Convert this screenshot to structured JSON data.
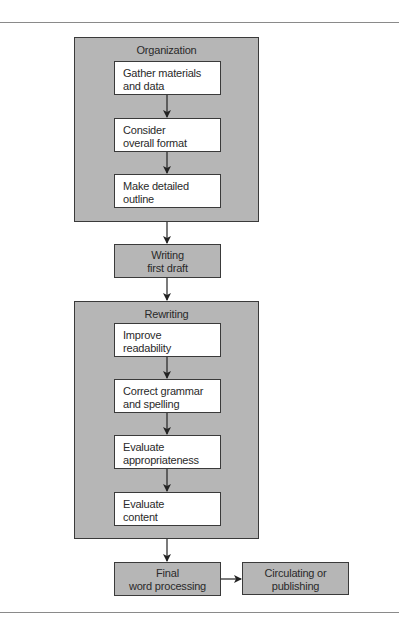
{
  "diagram": {
    "type": "flowchart",
    "groups": [
      {
        "id": "organization",
        "title": "Organization",
        "steps": [
          {
            "lines": [
              "Gather materials",
              "and data"
            ]
          },
          {
            "lines": [
              "Consider",
              "overall format"
            ]
          },
          {
            "lines": [
              "Make detailed",
              "outline"
            ]
          }
        ]
      },
      {
        "id": "rewriting",
        "title": "Rewriting",
        "steps": [
          {
            "lines": [
              "Improve",
              "readability"
            ]
          },
          {
            "lines": [
              "Correct grammar",
              "and spelling"
            ]
          },
          {
            "lines": [
              "Evaluate",
              "appropriateness"
            ]
          },
          {
            "lines": [
              "Evaluate",
              "content"
            ]
          }
        ]
      }
    ],
    "standalone_steps": [
      {
        "id": "writing",
        "lines": [
          "Writing",
          "first draft"
        ]
      },
      {
        "id": "final",
        "lines": [
          "Final",
          "word processing"
        ]
      },
      {
        "id": "circulating",
        "lines": [
          "Circulating or",
          "publishing"
        ]
      }
    ],
    "flow": [
      "Organization",
      "Writing first draft",
      "Rewriting",
      "Final word processing",
      "Circulating or publishing"
    ],
    "colors": {
      "group_fill": "#b6b6b6",
      "step_fill": "#ffffff",
      "border": "#3a3a3a",
      "rule": "#8a8a8a"
    }
  }
}
